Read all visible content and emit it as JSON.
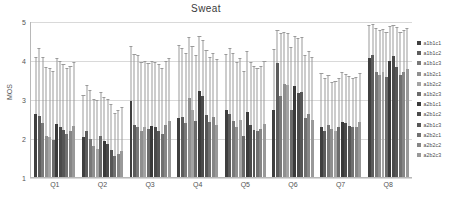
{
  "chart_data": {
    "type": "bar",
    "title": "Sweat",
    "xlabel": "",
    "ylabel": "MOS",
    "ylim": [
      1,
      5
    ],
    "yticks": [
      1,
      2,
      3,
      4,
      5
    ],
    "grid": true,
    "legend_position": "right",
    "categories": [
      "Q1",
      "Q2",
      "Q3",
      "Q4",
      "Q5",
      "Q6",
      "Q7",
      "Q8"
    ],
    "series": [
      {
        "name": "a1b1c1",
        "color": "#3f3f3f",
        "values": [
          2.62,
          2.02,
          2.95,
          2.53,
          2.74,
          2.72,
          2.3,
          4.08
        ],
        "err_high": [
          4.07,
          3.1,
          4.35,
          4.38,
          4.15,
          4.28,
          3.65,
          4.9
        ]
      },
      {
        "name": "a1b1c2",
        "color": "#5c5c5c",
        "values": [
          2.58,
          2.18,
          2.35,
          2.55,
          2.62,
          3.95,
          2.2,
          4.15
        ],
        "err_high": [
          4.3,
          3.35,
          4.15,
          4.3,
          4.3,
          4.78,
          3.52,
          4.92
        ]
      },
      {
        "name": "a1b1c3",
        "color": "#787878",
        "values": [
          2.4,
          1.98,
          2.3,
          2.4,
          2.45,
          3.1,
          2.35,
          3.7
        ],
        "err_high": [
          4.08,
          3.22,
          4.12,
          4.18,
          4.18,
          4.68,
          3.6,
          4.82
        ]
      },
      {
        "name": "a1b2c1",
        "color": "#8f8f8f",
        "values": [
          2.05,
          1.8,
          2.2,
          3.05,
          2.3,
          3.4,
          2.25,
          3.62
        ],
        "err_high": [
          3.82,
          2.98,
          3.95,
          4.58,
          3.95,
          4.72,
          3.42,
          4.78
        ]
      },
      {
        "name": "a1b2c2",
        "color": "#a3a3a3",
        "values": [
          2.02,
          1.72,
          2.28,
          2.72,
          2.48,
          3.38,
          2.18,
          3.7
        ],
        "err_high": [
          3.78,
          2.95,
          3.98,
          4.35,
          4.05,
          4.7,
          3.45,
          4.8
        ]
      },
      {
        "name": "a1b2c3",
        "color": "#6b6b6b",
        "values": [
          1.95,
          2.05,
          2.25,
          2.45,
          2.05,
          2.72,
          2.3,
          3.58
        ],
        "err_high": [
          3.72,
          3.18,
          3.92,
          4.12,
          3.7,
          4.32,
          3.52,
          4.72
        ]
      },
      {
        "name": "a2b1c1",
        "color": "#3a3a3a",
        "values": [
          2.38,
          1.92,
          2.32,
          3.22,
          2.68,
          3.35,
          2.42,
          4.0
        ],
        "err_high": [
          4.05,
          3.05,
          3.98,
          4.62,
          4.22,
          4.62,
          3.68,
          4.88
        ]
      },
      {
        "name": "a2b1c2",
        "color": "#4a4a4a",
        "values": [
          2.3,
          1.86,
          2.28,
          3.08,
          2.35,
          3.18,
          2.4,
          4.12
        ],
        "err_high": [
          3.98,
          2.98,
          3.95,
          4.5,
          3.95,
          4.55,
          3.62,
          4.9
        ]
      },
      {
        "name": "a2b1c3",
        "color": "#565656",
        "values": [
          2.22,
          1.7,
          2.2,
          2.6,
          2.22,
          3.2,
          2.32,
          3.85
        ],
        "err_high": [
          3.88,
          2.85,
          3.88,
          4.25,
          3.85,
          4.58,
          3.58,
          4.85
        ]
      },
      {
        "name": "a2b2c1",
        "color": "#707070",
        "values": [
          2.1,
          1.55,
          2.1,
          2.42,
          2.18,
          2.52,
          2.28,
          3.62
        ],
        "err_high": [
          3.78,
          2.62,
          3.78,
          4.08,
          3.78,
          4.12,
          3.52,
          4.72
        ]
      },
      {
        "name": "a2b2c2",
        "color": "#868686",
        "values": [
          2.18,
          1.6,
          2.35,
          2.55,
          2.25,
          2.62,
          2.3,
          3.7
        ],
        "err_high": [
          3.85,
          2.7,
          3.98,
          4.18,
          3.85,
          4.22,
          3.55,
          4.78
        ]
      },
      {
        "name": "a2b2c3",
        "color": "#999999",
        "values": [
          2.32,
          1.68,
          2.45,
          2.35,
          2.38,
          2.48,
          2.42,
          3.78
        ],
        "err_high": [
          3.95,
          2.78,
          4.05,
          4.02,
          3.98,
          4.08,
          3.65,
          4.82
        ]
      }
    ]
  },
  "axis": {
    "y_label": "MOS",
    "y_tick_labels": [
      "5",
      "4",
      "3",
      "2",
      "1"
    ]
  }
}
